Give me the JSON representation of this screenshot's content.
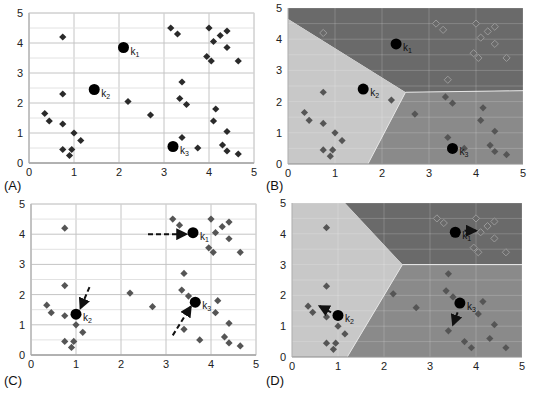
{
  "figure": {
    "colors": {
      "background": "#ffffff",
      "grid": "#cfcfcf",
      "point_dark": "#2a2a2a",
      "point_gray": "#555555",
      "point_light": "#9a9a9a",
      "region_light": "#c8c8c8",
      "region_medium": "#8a8a8a",
      "region_dark": "#6a6a6a",
      "centroid": "#000000"
    }
  },
  "chart_data": [
    {
      "panel": "(A)",
      "type": "scatter",
      "title": "",
      "xlabel": "",
      "ylabel": "",
      "xlim": [
        0,
        5
      ],
      "ylim": [
        0,
        5
      ],
      "xticks": [
        "0",
        "1",
        "2",
        "3",
        "4",
        "5"
      ],
      "yticks": [
        "0",
        "1",
        "2",
        "3",
        "4",
        "5"
      ],
      "grid": true,
      "box": {
        "x0": 29,
        "x1": 254,
        "y0": 163,
        "y1": 13
      },
      "points": [
        [
          0.75,
          4.2
        ],
        [
          0.75,
          2.3
        ],
        [
          0.35,
          1.65
        ],
        [
          0.45,
          1.4
        ],
        [
          0.75,
          1.3
        ],
        [
          1.0,
          1.0
        ],
        [
          1.15,
          0.75
        ],
        [
          0.75,
          0.45
        ],
        [
          0.95,
          0.45
        ],
        [
          0.9,
          0.25
        ],
        [
          2.2,
          2.05
        ],
        [
          2.7,
          1.6
        ],
        [
          3.15,
          4.5
        ],
        [
          3.3,
          4.3
        ],
        [
          4.0,
          4.5
        ],
        [
          4.4,
          4.4
        ],
        [
          4.25,
          4.25
        ],
        [
          4.1,
          4.05
        ],
        [
          4.4,
          3.85
        ],
        [
          3.95,
          3.55
        ],
        [
          4.05,
          3.4
        ],
        [
          4.65,
          3.4
        ],
        [
          3.4,
          2.7
        ],
        [
          3.35,
          2.15
        ],
        [
          3.5,
          1.95
        ],
        [
          4.15,
          1.8
        ],
        [
          4.1,
          1.4
        ],
        [
          4.4,
          1.05
        ],
        [
          3.4,
          0.85
        ],
        [
          3.75,
          0.5
        ],
        [
          4.3,
          0.6
        ],
        [
          4.4,
          0.4
        ],
        [
          4.65,
          0.3
        ]
      ],
      "centroids": [
        {
          "label": "k",
          "sub": "1",
          "x": 2.1,
          "y": 3.85
        },
        {
          "label": "k",
          "sub": "2",
          "x": 1.45,
          "y": 2.45
        },
        {
          "label": "k",
          "sub": "3",
          "x": 3.2,
          "y": 0.55
        }
      ],
      "regions": [],
      "arrows": []
    },
    {
      "panel": "(B)",
      "type": "scatter",
      "xlim": [
        0,
        5
      ],
      "ylim": [
        0,
        5
      ],
      "xticks": [
        "0",
        "1",
        "2",
        "3",
        "4",
        "5"
      ],
      "yticks": [
        "0",
        "1",
        "2",
        "3",
        "4",
        "5"
      ],
      "grid": true,
      "box": {
        "x0": 288,
        "x1": 523,
        "y0": 164,
        "y1": 8
      },
      "points": [
        [
          0.75,
          4.2
        ],
        [
          0.75,
          2.3
        ],
        [
          0.35,
          1.65
        ],
        [
          0.45,
          1.4
        ],
        [
          0.75,
          1.3
        ],
        [
          1.0,
          1.0
        ],
        [
          1.15,
          0.75
        ],
        [
          0.75,
          0.45
        ],
        [
          0.95,
          0.45
        ],
        [
          0.9,
          0.25
        ],
        [
          2.2,
          2.05
        ],
        [
          2.7,
          1.6
        ],
        [
          3.15,
          4.5
        ],
        [
          3.3,
          4.3
        ],
        [
          4.0,
          4.5
        ],
        [
          4.4,
          4.4
        ],
        [
          4.25,
          4.25
        ],
        [
          4.1,
          4.05
        ],
        [
          4.4,
          3.85
        ],
        [
          3.95,
          3.55
        ],
        [
          4.05,
          3.4
        ],
        [
          4.65,
          3.4
        ],
        [
          3.4,
          2.7
        ],
        [
          3.35,
          2.15
        ],
        [
          3.5,
          1.95
        ],
        [
          4.15,
          1.8
        ],
        [
          4.1,
          1.4
        ],
        [
          4.4,
          1.05
        ],
        [
          3.4,
          0.85
        ],
        [
          3.75,
          0.5
        ],
        [
          4.3,
          0.6
        ],
        [
          4.4,
          0.4
        ],
        [
          4.65,
          0.3
        ]
      ],
      "centroids": [
        {
          "label": "k",
          "sub": "1",
          "x": 2.3,
          "y": 3.85
        },
        {
          "label": "k",
          "sub": "2",
          "x": 1.6,
          "y": 2.4
        },
        {
          "label": "k",
          "sub": "3",
          "x": 3.5,
          "y": 0.5
        }
      ],
      "regions": [
        {
          "name": "cluster-1",
          "shade": "dark",
          "poly": [
            [
              0,
              4.65
            ],
            [
              0,
              5
            ],
            [
              5,
              5
            ],
            [
              5,
              2.35
            ],
            [
              2.5,
              2.3
            ]
          ]
        },
        {
          "name": "cluster-2",
          "shade": "light",
          "poly": [
            [
              0,
              0
            ],
            [
              0,
              4.65
            ],
            [
              2.5,
              2.3
            ],
            [
              1.7,
              0
            ]
          ]
        },
        {
          "name": "cluster-3",
          "shade": "medium",
          "poly": [
            [
              1.7,
              0
            ],
            [
              2.5,
              2.3
            ],
            [
              5,
              2.35
            ],
            [
              5,
              0
            ]
          ]
        }
      ],
      "arrows": []
    },
    {
      "panel": "(C)",
      "type": "scatter",
      "xlim": [
        0,
        5
      ],
      "ylim": [
        0,
        5
      ],
      "xticks": [
        "0",
        "1",
        "2",
        "3",
        "4",
        "5"
      ],
      "yticks": [
        "0",
        "1",
        "2",
        "3",
        "4",
        "5"
      ],
      "grid": true,
      "box": {
        "x0": 31,
        "x1": 256,
        "y0": 355,
        "y1": 204
      },
      "points": [
        [
          0.75,
          4.2
        ],
        [
          0.75,
          2.3
        ],
        [
          0.35,
          1.65
        ],
        [
          0.45,
          1.4
        ],
        [
          0.75,
          1.3
        ],
        [
          1.0,
          1.0
        ],
        [
          1.15,
          0.75
        ],
        [
          0.75,
          0.45
        ],
        [
          0.95,
          0.45
        ],
        [
          0.9,
          0.25
        ],
        [
          2.2,
          2.05
        ],
        [
          2.7,
          1.6
        ],
        [
          3.15,
          4.5
        ],
        [
          3.3,
          4.3
        ],
        [
          4.0,
          4.5
        ],
        [
          4.4,
          4.4
        ],
        [
          4.25,
          4.25
        ],
        [
          4.1,
          4.05
        ],
        [
          4.4,
          3.85
        ],
        [
          3.95,
          3.55
        ],
        [
          4.05,
          3.4
        ],
        [
          4.65,
          3.4
        ],
        [
          3.4,
          2.7
        ],
        [
          3.35,
          2.15
        ],
        [
          3.5,
          1.95
        ],
        [
          4.15,
          1.8
        ],
        [
          4.1,
          1.4
        ],
        [
          4.4,
          1.05
        ],
        [
          3.4,
          0.85
        ],
        [
          3.75,
          0.5
        ],
        [
          4.3,
          0.6
        ],
        [
          4.4,
          0.4
        ],
        [
          4.65,
          0.3
        ]
      ],
      "centroids": [
        {
          "label": "k",
          "sub": "1",
          "x": 3.6,
          "y": 4.05
        },
        {
          "label": "k",
          "sub": "2",
          "x": 1.0,
          "y": 1.35
        },
        {
          "label": "k",
          "sub": "3",
          "x": 3.65,
          "y": 1.75
        }
      ],
      "regions": [],
      "arrows": [
        {
          "from": [
            2.6,
            4.0
          ],
          "to": [
            3.45,
            4.0
          ],
          "style": "dashed"
        },
        {
          "from": [
            1.3,
            2.25
          ],
          "to": [
            1.1,
            1.55
          ],
          "style": "dashed"
        },
        {
          "from": [
            3.15,
            0.65
          ],
          "to": [
            3.55,
            1.6
          ],
          "style": "dashed"
        }
      ]
    },
    {
      "panel": "(D)",
      "type": "scatter",
      "xlim": [
        0,
        5
      ],
      "ylim": [
        0,
        5
      ],
      "xticks": [
        "0",
        "1",
        "2",
        "3",
        "4",
        "5"
      ],
      "yticks": [
        "0",
        "1",
        "2",
        "3",
        "4",
        "5"
      ],
      "grid": true,
      "box": {
        "x0": 292,
        "x1": 522,
        "y0": 357,
        "y1": 203
      },
      "points": [
        [
          0.75,
          4.2
        ],
        [
          0.75,
          2.3
        ],
        [
          0.35,
          1.65
        ],
        [
          0.45,
          1.45
        ],
        [
          0.75,
          1.3
        ],
        [
          1.0,
          1.0
        ],
        [
          1.15,
          0.75
        ],
        [
          0.75,
          0.45
        ],
        [
          0.95,
          0.45
        ],
        [
          0.9,
          0.25
        ],
        [
          2.2,
          2.05
        ],
        [
          2.7,
          1.6
        ],
        [
          3.15,
          4.5
        ],
        [
          3.3,
          4.35
        ],
        [
          4.0,
          4.5
        ],
        [
          4.4,
          4.4
        ],
        [
          4.25,
          4.25
        ],
        [
          4.1,
          4.05
        ],
        [
          4.4,
          3.85
        ],
        [
          3.95,
          3.55
        ],
        [
          4.05,
          3.4
        ],
        [
          4.65,
          3.4
        ],
        [
          3.4,
          2.7
        ],
        [
          3.35,
          2.15
        ],
        [
          3.5,
          1.95
        ],
        [
          4.15,
          1.8
        ],
        [
          4.05,
          1.4
        ],
        [
          4.4,
          1.05
        ],
        [
          3.4,
          0.85
        ],
        [
          3.75,
          0.5
        ],
        [
          4.3,
          0.6
        ],
        [
          3.9,
          0.3
        ],
        [
          4.65,
          0.3
        ]
      ],
      "centroids": [
        {
          "label": "k",
          "sub": "1",
          "x": 3.55,
          "y": 4.05
        },
        {
          "label": "k",
          "sub": "2",
          "x": 1.0,
          "y": 1.35
        },
        {
          "label": "k",
          "sub": "3",
          "x": 3.65,
          "y": 1.75
        }
      ],
      "regions": [
        {
          "name": "cluster-1",
          "shade": "dark",
          "poly": [
            [
              1.15,
              5
            ],
            [
              5,
              5
            ],
            [
              5,
              3
            ],
            [
              2.4,
              3
            ]
          ]
        },
        {
          "name": "cluster-2",
          "shade": "light",
          "poly": [
            [
              0,
              0
            ],
            [
              0,
              5
            ],
            [
              1.15,
              5
            ],
            [
              2.4,
              3
            ],
            [
              1.2,
              0
            ]
          ]
        },
        {
          "name": "cluster-3",
          "shade": "medium",
          "poly": [
            [
              1.2,
              0
            ],
            [
              2.4,
              3
            ],
            [
              5,
              3
            ],
            [
              5,
              0
            ]
          ]
        }
      ],
      "arrows": [
        {
          "from": [
            3.75,
            4.1
          ],
          "to": [
            4.0,
            4.1
          ],
          "style": "solid"
        },
        {
          "from": [
            0.85,
            1.45
          ],
          "to": [
            0.6,
            1.65
          ],
          "style": "solid"
        },
        {
          "from": [
            3.6,
            1.45
          ],
          "to": [
            3.5,
            1.05
          ],
          "style": "solid"
        }
      ]
    }
  ],
  "panel_labels": [
    {
      "text": "(A)",
      "x": 4,
      "y": 190
    },
    {
      "text": "(B)",
      "x": 266,
      "y": 190
    },
    {
      "text": "(C)",
      "x": 4,
      "y": 385
    },
    {
      "text": "(D)",
      "x": 266,
      "y": 385
    }
  ]
}
